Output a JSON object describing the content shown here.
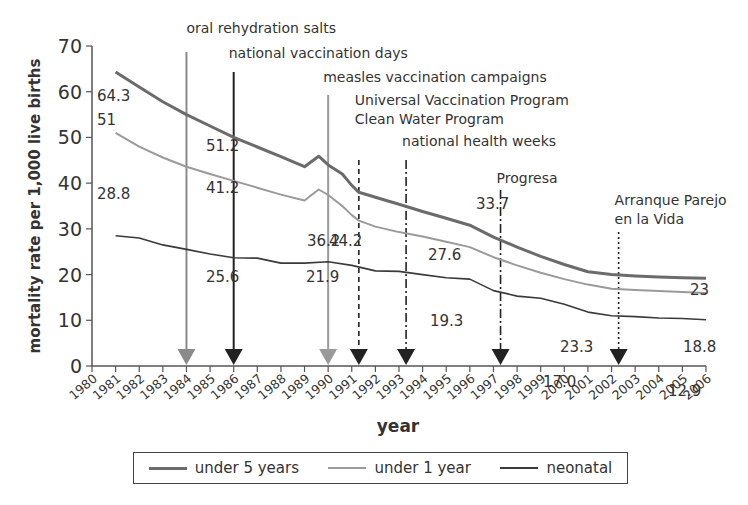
{
  "chart_data": {
    "type": "line",
    "title": "",
    "xlabel": "year",
    "ylabel": "mortality rate per 1,000 live births",
    "ylim": [
      0,
      70
    ],
    "yticks": [
      0,
      10,
      20,
      30,
      40,
      50,
      60,
      70
    ],
    "x": [
      1980,
      1981,
      1982,
      1983,
      1984,
      1985,
      1986,
      1987,
      1988,
      1989,
      1990,
      1991,
      1992,
      1993,
      1994,
      1995,
      1996,
      1997,
      1998,
      1999,
      2000,
      2001,
      2002,
      2003,
      2004,
      2005,
      2006
    ],
    "xtick_labels": [
      "1980",
      "1981",
      "1982",
      "1983",
      "1984",
      "1985",
      "1986",
      "1987",
      "1988",
      "1989",
      "1990",
      "1991",
      "1992",
      "1993",
      "1994",
      "1995",
      "1996",
      "1997",
      "1998",
      "1999",
      "2000",
      "2001",
      "2002",
      "2003",
      "2004",
      "2005",
      "2006"
    ],
    "grid": false,
    "legend_position": "bottom",
    "series": [
      {
        "name": "under 5 years",
        "color": "#6b6b6b",
        "width": 3,
        "x": [
          1981,
          1982,
          1983,
          1984,
          1985,
          1986,
          1987,
          1988,
          1989,
          1989.6,
          1990,
          1990.6,
          1991,
          1991.3,
          1992,
          1993,
          1994,
          1995,
          1996,
          1997,
          1998,
          1999,
          2000,
          2001,
          2002,
          2003,
          2004,
          2005,
          2006
        ],
        "values": [
          64.3,
          61.0,
          57.8,
          55.0,
          52.5,
          50.0,
          47.9,
          45.8,
          43.6,
          45.9,
          44.0,
          42.0,
          39.5,
          38.0,
          36.9,
          35.4,
          33.8,
          32.3,
          30.8,
          28.2,
          26.0,
          24.0,
          22.2,
          20.6,
          20.0,
          19.7,
          19.5,
          19.3,
          19.2
        ],
        "labels": [
          {
            "x": 1981,
            "text": "64.3"
          },
          {
            "x": 1986,
            "text": "51.2"
          },
          {
            "x": 1991,
            "text": "44.2"
          },
          {
            "x": 1996,
            "text": "33.7"
          },
          {
            "x": 2006,
            "text": "23"
          }
        ]
      },
      {
        "name": "under 1 year",
        "color": "#9a9a9a",
        "width": 2,
        "x": [
          1981,
          1982,
          1983,
          1984,
          1985,
          1986,
          1987,
          1988,
          1989,
          1989.6,
          1990,
          1990.6,
          1991,
          1991.3,
          1992,
          1993,
          1994,
          1995,
          1996,
          1997,
          1998,
          1999,
          2000,
          2001,
          2002,
          2003,
          2004,
          2005,
          2006
        ],
        "values": [
          51.0,
          48.0,
          45.6,
          43.6,
          42.0,
          40.5,
          39.0,
          37.5,
          36.2,
          38.6,
          37.4,
          35.0,
          33.0,
          31.8,
          30.5,
          29.3,
          28.3,
          27.2,
          26.0,
          23.8,
          22.0,
          20.4,
          19.0,
          17.8,
          16.9,
          16.6,
          16.4,
          16.2,
          16.0
        ],
        "labels": [
          {
            "x": 1981,
            "text": "51"
          },
          {
            "x": 1986,
            "text": "41.2"
          },
          {
            "x": 1990,
            "text": "36.2"
          },
          {
            "x": 1994,
            "text": "27.6"
          },
          {
            "x": 2000,
            "text": "23.3"
          },
          {
            "x": 2006,
            "text": "18.8"
          }
        ]
      },
      {
        "name": "neonatal",
        "color": "#3a3a3a",
        "width": 1.6,
        "x": [
          1981,
          1982,
          1983,
          1984,
          1985,
          1986,
          1987,
          1988,
          1989,
          1990,
          1991,
          1992,
          1993,
          1994,
          1995,
          1996,
          1997,
          1998,
          1999,
          2000,
          2001,
          2002,
          2003,
          2004,
          2005,
          2006
        ],
        "values": [
          28.5,
          28.0,
          26.5,
          25.5,
          24.5,
          23.7,
          23.6,
          22.5,
          22.5,
          22.8,
          22.0,
          20.8,
          20.7,
          20.0,
          19.3,
          19.0,
          16.5,
          15.3,
          14.8,
          13.5,
          11.8,
          11.0,
          10.8,
          10.5,
          10.4,
          10.1
        ],
        "labels": [
          {
            "x": 1981,
            "text": "28.8"
          },
          {
            "x": 1986,
            "text": "25.6"
          },
          {
            "x": 1990,
            "text": "21.9"
          },
          {
            "x": 1995,
            "text": "19.3"
          },
          {
            "x": 2000,
            "text": "17.0"
          },
          {
            "x": 2006,
            "text": "12.9"
          }
        ]
      }
    ],
    "annotations": [
      {
        "year": 1984,
        "text": [
          "oral rehydration salts"
        ],
        "style": "solid",
        "color": "#8a8a8a"
      },
      {
        "year": 1986,
        "text": [
          "national vaccination days"
        ],
        "style": "solid",
        "color": "#222222"
      },
      {
        "year": 1990,
        "text": [
          "measles vaccination campaigns"
        ],
        "style": "solid",
        "color": "#9a9a9a"
      },
      {
        "year": 1991.3,
        "text": [
          "Universal Vaccination Program",
          "Clean Water Program"
        ],
        "style": "dashed",
        "color": "#222222"
      },
      {
        "year": 1993.3,
        "text": [
          "national health weeks"
        ],
        "style": "dashdot",
        "color": "#222222"
      },
      {
        "year": 1997.3,
        "text": [
          "Progresa"
        ],
        "style": "dashdot",
        "color": "#222222"
      },
      {
        "year": 2002.3,
        "text": [
          "Arranque Parejo",
          "en la Vida"
        ],
        "style": "dotted",
        "color": "#222222"
      }
    ]
  },
  "legend": {
    "items": [
      {
        "label": "under 5 years",
        "color": "#6b6b6b"
      },
      {
        "label": "under 1 year",
        "color": "#9a9a9a"
      },
      {
        "label": "neonatal",
        "color": "#3a3a3a"
      }
    ]
  }
}
